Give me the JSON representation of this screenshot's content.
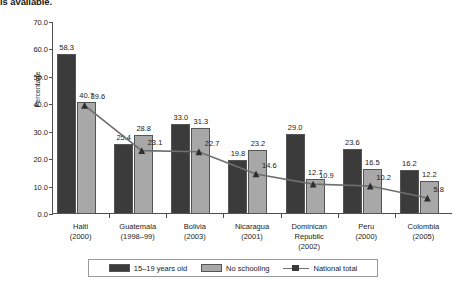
{
  "caption": {
    "text": "is available."
  },
  "chart_data": {
    "type": "bar",
    "title": "",
    "xlabel": "",
    "ylabel": "Percentage",
    "ylim": [
      0,
      70
    ],
    "ytick_step": 10,
    "ytick_labels": [
      "0.0",
      "10.0",
      "20.0",
      "30.0",
      "40.0",
      "50.0",
      "60.0",
      "70.0"
    ],
    "grid": false,
    "legend_position": "bottom",
    "categories": [
      "Haiti",
      "Guatemala",
      "Bolivia",
      "Nicaragua",
      "Dominican Republic",
      "Peru",
      "Colombia"
    ],
    "category_years": [
      "(2000)",
      "(1998–99)",
      "(2003)",
      "(2001)",
      "(2002)",
      "(2000)",
      "(2005)"
    ],
    "series": [
      {
        "name": "15–19 years old",
        "kind": "bar",
        "color": "#3b3b3b",
        "values": [
          58.3,
          25.4,
          33.0,
          19.8,
          29.0,
          23.6,
          16.2
        ],
        "labels": [
          "58.3",
          "25.4",
          "33.0",
          "19.8",
          "29.0",
          "23.6",
          "16.2"
        ]
      },
      {
        "name": "No schooling",
        "kind": "bar",
        "color": "#a8a8a8",
        "values": [
          40.7,
          28.8,
          31.3,
          23.2,
          12.7,
          16.5,
          12.2
        ],
        "labels": [
          "40.7",
          "28.8",
          "31.3",
          "23.2",
          "12.7",
          "16.5",
          "12.2"
        ]
      },
      {
        "name": "National total",
        "kind": "line",
        "color": "#6f6f6f",
        "values": [
          39.6,
          23.1,
          22.7,
          14.6,
          10.9,
          10.2,
          5.8
        ],
        "labels": [
          "39.6",
          "23.1",
          "22.7",
          "14.6",
          "10.9",
          "10.2",
          "5.8"
        ]
      }
    ]
  },
  "legend": {
    "items": [
      {
        "label": "15–19 years old",
        "swatch": "dark-square"
      },
      {
        "label": "No schooling",
        "swatch": "light-square"
      },
      {
        "label": "National total",
        "swatch": "line-marker"
      }
    ]
  }
}
